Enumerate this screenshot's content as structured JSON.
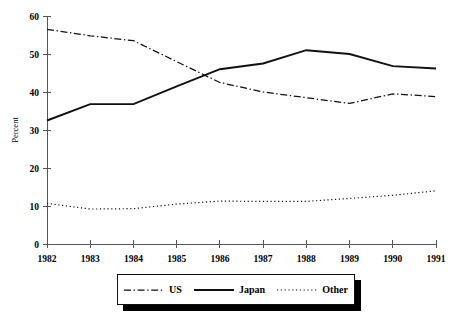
{
  "chart_data": {
    "type": "line",
    "title": "",
    "xlabel": "",
    "ylabel": "Percent",
    "x": [
      "1982",
      "1983",
      "1984",
      "1985",
      "1986",
      "1987",
      "1988",
      "1989",
      "1990",
      "1991"
    ],
    "xlim": [
      1982,
      1991
    ],
    "ylim": [
      0,
      60
    ],
    "yticks": [
      0,
      10,
      20,
      30,
      40,
      50,
      60
    ],
    "ytick_labels": [
      "0",
      "10",
      "20",
      "30",
      "40",
      "50",
      "60"
    ],
    "grid": false,
    "legend_position": "bottom-center",
    "series": [
      {
        "name": "US",
        "style": "dash-dot",
        "color": "#111111",
        "values": [
          56.5,
          54.8,
          53.5,
          48.0,
          42.5,
          40.0,
          38.5,
          37.0,
          39.5,
          38.8
        ]
      },
      {
        "name": "Japan",
        "style": "solid",
        "color": "#111111",
        "values": [
          32.5,
          36.8,
          36.8,
          41.5,
          46.0,
          47.5,
          51.0,
          50.0,
          46.8,
          46.2
        ]
      },
      {
        "name": "Other",
        "style": "dotted",
        "color": "#111111",
        "values": [
          10.7,
          9.2,
          9.3,
          10.5,
          11.3,
          11.2,
          11.2,
          12.0,
          12.8,
          14.0
        ]
      }
    ]
  },
  "legend": {
    "items": [
      {
        "label": "US"
      },
      {
        "label": "Japan"
      },
      {
        "label": "Other"
      }
    ]
  },
  "axes": {
    "y_title": "Percent"
  }
}
